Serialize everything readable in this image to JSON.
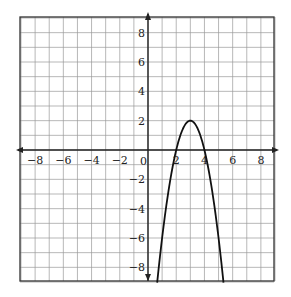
{
  "chart_data": {
    "type": "line",
    "title": "",
    "xlabel": "",
    "ylabel": "",
    "xlim": [
      -9,
      9
    ],
    "ylim": [
      -9,
      9
    ],
    "grid": true,
    "x_ticks": [
      -8,
      -6,
      -4,
      -2,
      2,
      4,
      6,
      8
    ],
    "y_ticks": [
      8,
      6,
      4,
      2,
      -2,
      -4,
      -6,
      -8
    ],
    "origin_label": "0",
    "series": [
      {
        "name": "parabola",
        "equation": "y = -2(x-3)^2 + 2",
        "vertex": [
          3,
          2
        ],
        "x_intercepts": [
          2,
          4
        ],
        "x": [
          0.65,
          1,
          1.5,
          2,
          2.5,
          3,
          3.5,
          4,
          4.5,
          5,
          5.35
        ],
        "values": [
          -9,
          -6,
          -2.5,
          0,
          1.5,
          2,
          1.5,
          0,
          -2.5,
          -6,
          -9
        ]
      }
    ],
    "colors": {
      "grid": "#999999",
      "axis": "#222222",
      "curve": "#111111",
      "border": "#333333"
    }
  }
}
